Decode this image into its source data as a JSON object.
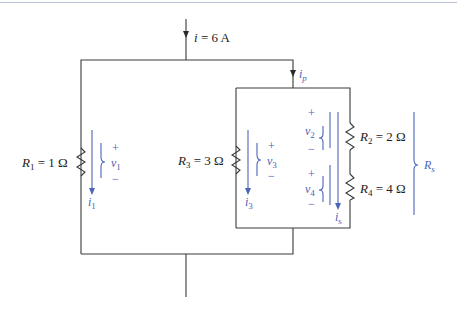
{
  "diagram": {
    "type": "circuit",
    "source_current": {
      "symbol": "i",
      "value": "6 A",
      "label": "i = 6 A"
    },
    "parallel_current": {
      "symbol": "i",
      "sub": "p"
    },
    "series_current": {
      "symbol": "i",
      "sub": "s"
    },
    "equivalent_resistance": {
      "symbol": "R",
      "sub": "s"
    },
    "resistors": [
      {
        "symbol": "R",
        "sub": "1",
        "eq": " = 1 Ω",
        "voltage": "v",
        "vsub": "1",
        "current": "i",
        "isub": "1"
      },
      {
        "symbol": "R",
        "sub": "2",
        "eq": " = 2 Ω",
        "voltage": "v",
        "vsub": "2"
      },
      {
        "symbol": "R",
        "sub": "3",
        "eq": " = 3 Ω",
        "voltage": "v",
        "vsub": "3",
        "current": "i",
        "isub": "3"
      },
      {
        "symbol": "R",
        "sub": "4",
        "eq": " = 4 Ω",
        "voltage": "v",
        "vsub": "4"
      }
    ],
    "polarity": {
      "plus": "+",
      "minus": "−"
    }
  }
}
